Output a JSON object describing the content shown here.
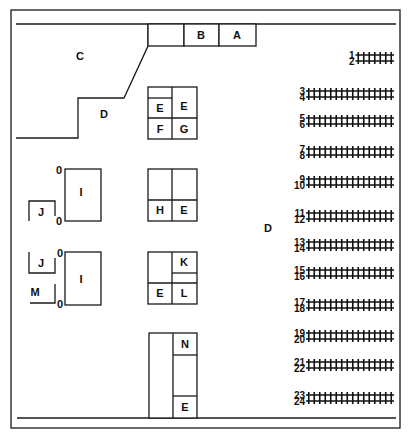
{
  "diagram": {
    "type": "floor-plan",
    "colors": {
      "line": "#1a1a1a",
      "background": "#ffffff"
    },
    "areas": {
      "A": "A",
      "B": "B",
      "C": "C",
      "D_left": "D",
      "D_center": "D"
    },
    "upper_block": {
      "top_left": "E",
      "top_right": "E",
      "bottom_left": "F",
      "bottom_right": "G"
    },
    "middle_block": {
      "bottom_left": "H",
      "bottom_right": "E"
    },
    "lower_block": {
      "top_right": "K",
      "bottom_left": "E",
      "bottom_right": "L"
    },
    "bottom_block": {
      "top": "N",
      "bottom": "E"
    },
    "left_units": {
      "upper": {
        "booth": "I",
        "side": "J",
        "mark_top": "0",
        "mark_bottom": "0"
      },
      "lower": {
        "booth": "I",
        "side": "J",
        "extra": "M",
        "mark_top": "0",
        "mark_bottom": "0"
      }
    },
    "seat_rows": [
      {
        "number": "1",
        "seats": 7
      },
      {
        "number": "2",
        "seats": 7
      },
      {
        "number": "3",
        "seats": 16
      },
      {
        "number": "4",
        "seats": 16
      },
      {
        "number": "5",
        "seats": 16
      },
      {
        "number": "6",
        "seats": 16
      },
      {
        "number": "7",
        "seats": 16
      },
      {
        "number": "8",
        "seats": 16
      },
      {
        "number": "9",
        "seats": 16
      },
      {
        "number": "10",
        "seats": 16
      },
      {
        "number": "11",
        "seats": 16
      },
      {
        "number": "12",
        "seats": 16
      },
      {
        "number": "13",
        "seats": 16
      },
      {
        "number": "14",
        "seats": 16
      },
      {
        "number": "15",
        "seats": 16
      },
      {
        "number": "16",
        "seats": 16
      },
      {
        "number": "17",
        "seats": 16
      },
      {
        "number": "18",
        "seats": 16
      },
      {
        "number": "19",
        "seats": 16
      },
      {
        "number": "20",
        "seats": 16
      },
      {
        "number": "21",
        "seats": 16
      },
      {
        "number": "22",
        "seats": 16
      },
      {
        "number": "23",
        "seats": 16
      },
      {
        "number": "24",
        "seats": 16
      }
    ]
  }
}
